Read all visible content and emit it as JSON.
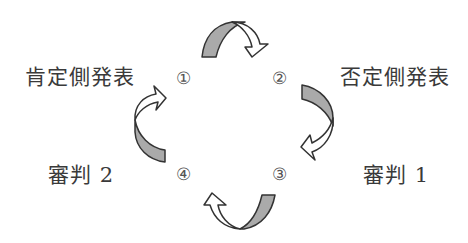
{
  "diagram": {
    "type": "cycle",
    "nodes": [
      {
        "step": "①",
        "label": "肯定側発表"
      },
      {
        "step": "②",
        "label": "否定側発表"
      },
      {
        "step": "③",
        "label": "審判 1"
      },
      {
        "step": "④",
        "label": "審判 2"
      }
    ],
    "flow": [
      "①→②",
      "②→③",
      "③→④",
      "④→①"
    ],
    "colors": {
      "arrow_fill": "#aaaaaa",
      "arrow_head": "#ffffff",
      "stroke": "#333333"
    }
  }
}
